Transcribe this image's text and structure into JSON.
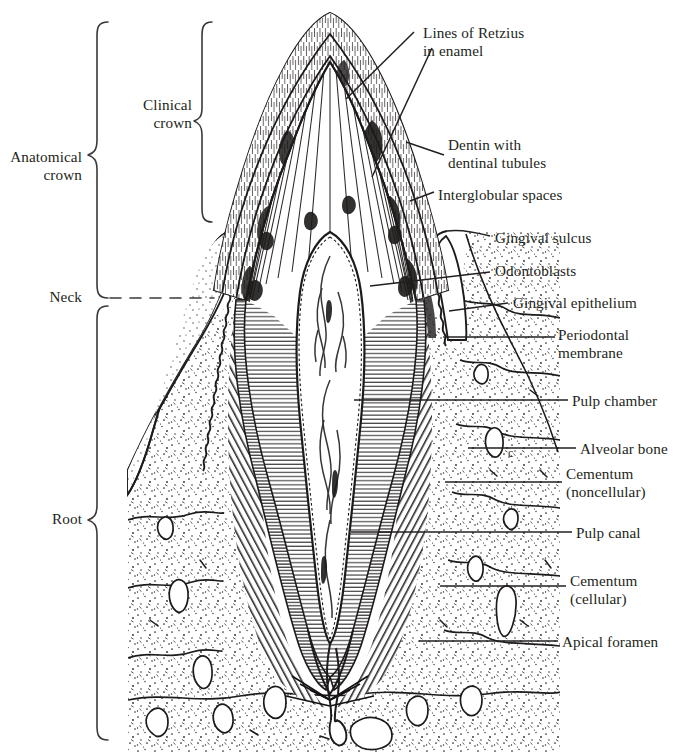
{
  "figure": {
    "domain": "anatomical line drawing",
    "background_color": "#ffffff",
    "ink_color": "#231f20",
    "width": 676,
    "height": 755
  },
  "region_labels": {
    "anatomical_crown": "Anatomical\ncrown",
    "clinical_crown": "Clinical\ncrown",
    "neck": "Neck",
    "root": "Root"
  },
  "structure_labels": {
    "lines_of_retzius": "Lines of Retzius\nin enamel",
    "dentin": "Dentin with\ndentinal tubules",
    "interglobular_spaces": "Interglobular spaces",
    "gingival_sulcus": "Gingival sulcus",
    "odontoblasts": "Odontoblasts",
    "gingival_epithelium": "Gingival epithelium",
    "periodontal_membrane": "Periodontal\nmembrane",
    "pulp_chamber": "Pulp chamber",
    "alveolar_bone": "Alveolar bone",
    "cementum_noncellular": "Cementum\n(noncellular)",
    "pulp_canal": "Pulp canal",
    "cementum_cellular": "Cementum\n(cellular)",
    "apical_foramen": "Apical foramen"
  },
  "label_positions": {
    "anatomical_crown": {
      "x": 4,
      "y": 148,
      "align": "right",
      "w": 78
    },
    "clinical_crown": {
      "x": 120,
      "y": 96,
      "align": "right",
      "w": 72
    },
    "neck": {
      "x": 20,
      "y": 288,
      "align": "right",
      "w": 62
    },
    "root": {
      "x": 24,
      "y": 510,
      "align": "right",
      "w": 58
    },
    "lines_of_retzius": {
      "x": 423,
      "y": 24,
      "align": "left",
      "w": 180
    },
    "dentin": {
      "x": 448,
      "y": 136,
      "align": "left",
      "w": 180
    },
    "interglobular_spaces": {
      "x": 438,
      "y": 186,
      "align": "left",
      "w": 200
    },
    "gingival_sulcus": {
      "x": 495,
      "y": 229,
      "align": "left",
      "w": 180
    },
    "odontoblasts": {
      "x": 495,
      "y": 262,
      "align": "left",
      "w": 160
    },
    "gingival_epithelium": {
      "x": 513,
      "y": 294,
      "align": "left",
      "w": 180
    },
    "periodontal_membrane": {
      "x": 558,
      "y": 334,
      "align": "left",
      "w": 130
    },
    "pulp_chamber": {
      "x": 572,
      "y": 393,
      "align": "left",
      "w": 150
    },
    "alveolar_bone": {
      "x": 580,
      "y": 441,
      "align": "left",
      "w": 150
    },
    "cementum_noncellular": {
      "x": 566,
      "y": 470,
      "align": "left",
      "w": 140
    },
    "pulp_canal": {
      "x": 576,
      "y": 525,
      "align": "left",
      "w": 130
    },
    "cementum_cellular": {
      "x": 570,
      "y": 578,
      "align": "left",
      "w": 140
    },
    "apical_foramen": {
      "x": 562,
      "y": 634,
      "align": "left",
      "w": 150
    }
  },
  "leader_lines": {
    "lines_of_retzius_a": {
      "x1": 414,
      "y1": 32,
      "x2": 346,
      "y2": 99
    },
    "lines_of_retzius_b": {
      "x1": 432,
      "y1": 48,
      "x2": 372,
      "y2": 177
    },
    "dentin": {
      "x1": 444,
      "y1": 155,
      "x2": 406,
      "y2": 142
    },
    "interglobular_spaces": {
      "x1": 434,
      "y1": 192,
      "x2": 412,
      "y2": 200
    },
    "gingival_sulcus": {
      "x1": 490,
      "y1": 236,
      "x2": 447,
      "y2": 231
    },
    "odontoblasts": {
      "x1": 490,
      "y1": 272,
      "x2": 370,
      "y2": 286
    },
    "gingival_epithelium": {
      "x1": 508,
      "y1": 303,
      "x2": 449,
      "y2": 311
    },
    "periodontal_membrane": {
      "x1": 555,
      "y1": 337,
      "x2": 446,
      "y2": 337
    },
    "pulp_chamber": {
      "x1": 568,
      "y1": 400,
      "x2": 354,
      "y2": 400
    },
    "alveolar_bone": {
      "x1": 576,
      "y1": 448,
      "x2": 468,
      "y2": 448
    },
    "cementum_noncellular": {
      "x1": 562,
      "y1": 482,
      "x2": 445,
      "y2": 482
    },
    "pulp_canal": {
      "x1": 572,
      "y1": 532,
      "x2": 351,
      "y2": 532
    },
    "cementum_cellular": {
      "x1": 566,
      "y1": 586,
      "x2": 440,
      "y2": 586
    },
    "apical_foramen": {
      "x1": 558,
      "y1": 641,
      "x2": 419,
      "y2": 641
    }
  },
  "brackets": {
    "anatomical_crown": {
      "x": 96,
      "top": 20,
      "bottom": 740,
      "tip": 155,
      "depth": 14
    },
    "clinical_crown": {
      "x": 200,
      "top": 20,
      "bottom": 222,
      "tip": 120,
      "depth": 12
    },
    "neck_dash": {
      "x1": 110,
      "y": 298,
      "x2": 212
    },
    "root": {
      "x": 96,
      "top": 304,
      "bottom": 740,
      "tip": 520,
      "depth": 14
    }
  },
  "anatomy": {
    "crown_apex": {
      "x": 330,
      "y": 12
    },
    "pulp_chamber_fill": "#ffffff",
    "enamel_fill": "#ffffff",
    "dentin_fill": "#ffffff",
    "bone_fill": "#ffffff",
    "bone_field": {
      "left": 128,
      "right": 560,
      "top": 232,
      "bottom": 752
    }
  }
}
